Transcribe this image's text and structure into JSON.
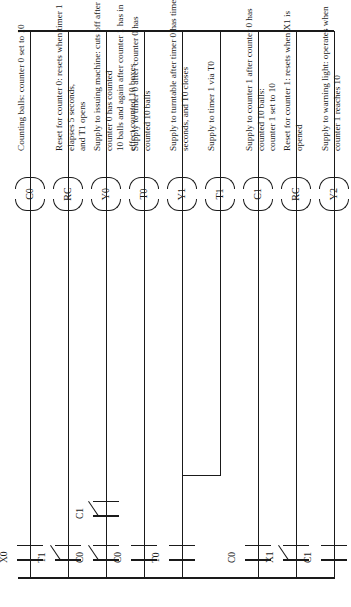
{
  "diagram": {
    "orientation": "rotated-90",
    "line_color": "#1a1a1a",
    "background": "#ffffff"
  },
  "rungs": [
    {
      "id": "rung-1",
      "coil": "C0",
      "contacts": [
        {
          "label": "X0",
          "type": "NO"
        }
      ],
      "description": "Counting balls:  counter 0 set to 10"
    },
    {
      "id": "rung-2",
      "coil": "RC",
      "contacts": [
        {
          "label": "T1",
          "type": "NC"
        }
      ],
      "description": "Reset for counter 0:  resets when timer 1 elapses 5 seconds,\nand T1 opens"
    },
    {
      "id": "rung-3",
      "coil": "Y0",
      "contacts": [
        {
          "label": "C0",
          "type": "NC"
        },
        {
          "label": "C1",
          "type": "NC"
        }
      ],
      "description": "Supply to issuing machine:  cuts off after counter 0 has counted\n10 balls and again after counter 1 has in effect counted 10 boxes"
    },
    {
      "id": "rung-4",
      "coil": "T0",
      "contacts": [
        {
          "label": "C0",
          "type": "NO"
        }
      ],
      "description": "Supply to timer 0 after counter 0 has counted 10 balls"
    },
    {
      "id": "rung-5",
      "coil": "Y1",
      "contacts": [
        {
          "label": "T0",
          "type": "NO"
        }
      ],
      "description": "Supply to turntable after timer 0 has timed 5 seconds, and T0 closes"
    },
    {
      "id": "rung-6",
      "coil": "T1",
      "contacts": [],
      "description": "Supply to timer 1 via T0"
    },
    {
      "id": "rung-7",
      "coil": "C1",
      "contacts": [
        {
          "label": "C0",
          "type": "NO"
        }
      ],
      "description": "Supply to counter 1 after counter 0 has counted  10 balls:\ncounter 1 set to 10"
    },
    {
      "id": "rung-8",
      "coil": "RC",
      "contacts": [
        {
          "label": "X1",
          "type": "NC"
        }
      ],
      "description": "Reset for counter 1:  resets when X1 is opened"
    },
    {
      "id": "rung-9",
      "coil": "Y2",
      "contacts": [
        {
          "label": "C1",
          "type": "NO"
        }
      ],
      "description": "Supply to warning light:  operates when counter 1 reaches 10"
    }
  ]
}
